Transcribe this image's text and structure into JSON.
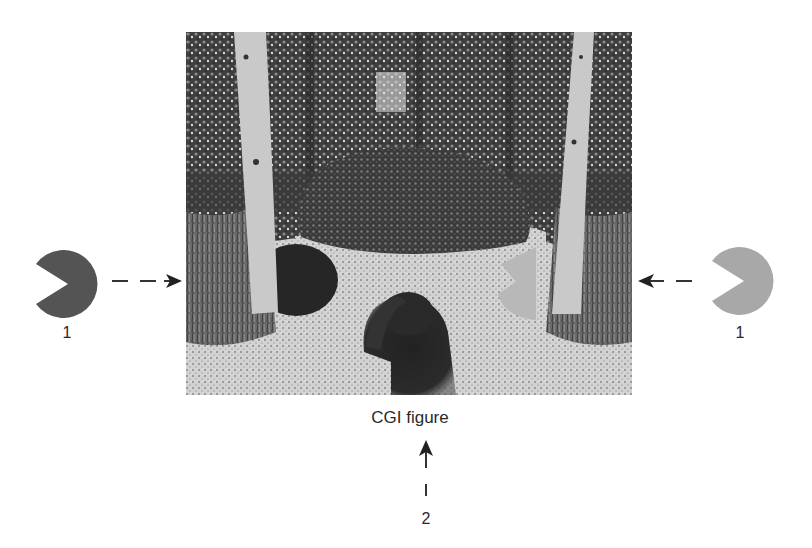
{
  "figure": {
    "caption": "CGI figure",
    "left_inducer": {
      "label": "1",
      "shade": "dark",
      "color": "#545454",
      "mouth_direction": "left"
    },
    "right_inducer": {
      "label": "1",
      "shade": "light",
      "color": "#a8a8a8",
      "mouth_direction": "left"
    },
    "bottom_pointer": {
      "label": "2"
    },
    "scene": {
      "description": "Forest path scene with two birch trees, central bush, dark pac-man disc behind left tree, light pac-man disc by right tree, and a dark blurred figure on the path",
      "colors": {
        "dark_disc": "#2a2a2a",
        "light_disc": "#b5b5b5",
        "path": "#cfcfcf",
        "trees_bg": "#4a4a4a",
        "trunk": "#c9c9c9"
      }
    }
  }
}
